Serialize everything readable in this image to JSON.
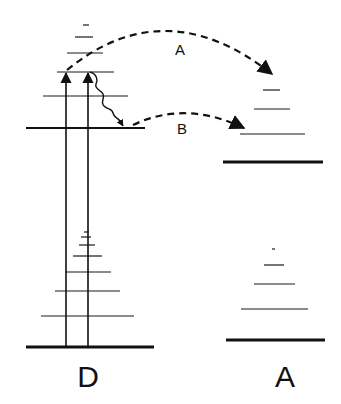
{
  "diagram": {
    "title": "",
    "colors": {
      "ink": "#111111",
      "background": "#ffffff"
    },
    "donor": {
      "label": "D",
      "ground_state_y": 347,
      "excited_state_y": 128,
      "lower_vibrational_levels": [
        316,
        291,
        272,
        256,
        245,
        237,
        232
      ],
      "upper_vibrational_levels": [
        96,
        72,
        53,
        37,
        25
      ]
    },
    "acceptor": {
      "label": "A",
      "ground_state_y": 340,
      "excited_state_y": 162,
      "lower_vibrational_levels": [
        309,
        284,
        265,
        249
      ],
      "upper_vibrational_levels": [
        134,
        109,
        90
      ]
    },
    "transitions": {
      "excitation_arrows": 2,
      "relaxation": "wavy arrow from upper vibrational level to excited state",
      "path_a_label": "A",
      "path_b_label": "B"
    }
  }
}
